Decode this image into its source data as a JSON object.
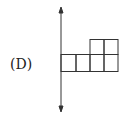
{
  "option": {
    "label": "(D)"
  },
  "diagram": {
    "axis": {
      "x": 61,
      "y_top": 8,
      "y_bottom": 112
    },
    "bottom_row": {
      "y_top": 54,
      "y_bottom": 71,
      "columns_x": [
        61,
        76,
        90,
        104,
        118
      ]
    },
    "top_row": {
      "y_top": 39,
      "y_bottom": 54,
      "columns_x": [
        90,
        104,
        118
      ]
    },
    "stroke_color": "#333333"
  }
}
